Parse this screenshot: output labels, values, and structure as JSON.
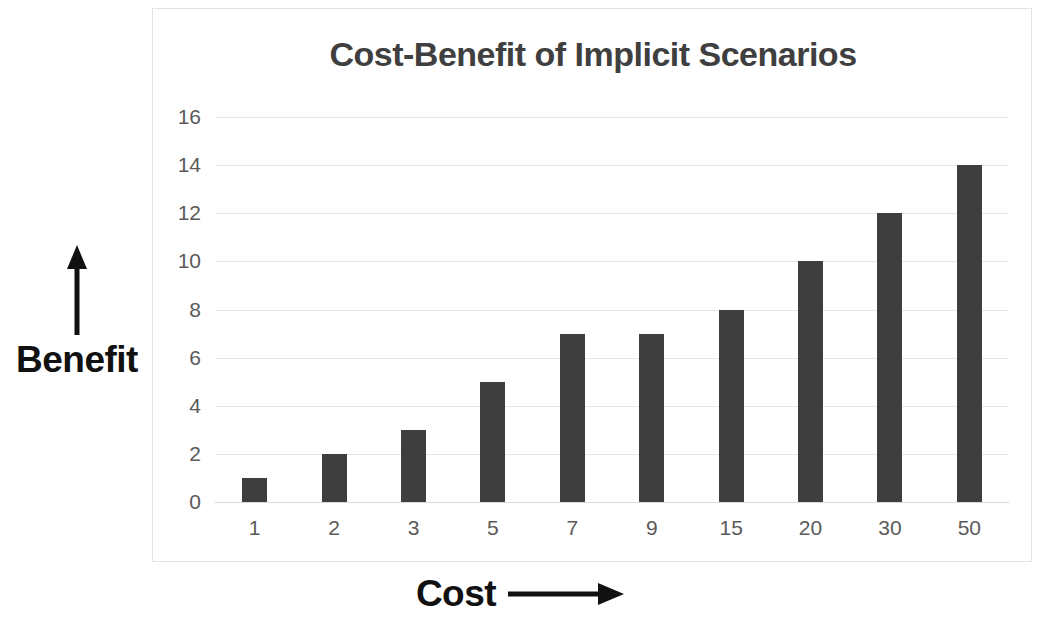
{
  "chart_data": {
    "type": "bar",
    "title": "Cost-Benefit of Implicit Scenarios",
    "xlabel": "Cost",
    "ylabel": "Benefit",
    "categories": [
      "1",
      "2",
      "3",
      "5",
      "7",
      "9",
      "15",
      "20",
      "30",
      "50"
    ],
    "values": [
      1,
      2,
      3,
      5,
      7,
      7,
      8,
      10,
      12,
      14
    ],
    "series": [
      {
        "name": "Benefit",
        "values": [
          1,
          2,
          3,
          5,
          7,
          7,
          8,
          10,
          12,
          14
        ]
      }
    ],
    "ylim": [
      0,
      16
    ],
    "yticks": [
      0,
      2,
      4,
      6,
      8,
      10,
      12,
      14,
      16
    ],
    "ytick_labels": [
      "0",
      "2",
      "4",
      "6",
      "8",
      "10",
      "12",
      "14",
      "16"
    ],
    "grid": true,
    "legend": false,
    "legend_position": "none",
    "bar_color": "#3e3e3e",
    "gridline_color": "#e6e6e6",
    "title_color": "#3f3f3f",
    "tick_label_color": "#5a5a5a",
    "axis_label_color": "#111111",
    "frame_color": "#e3e3e3",
    "background_color": "#ffffff",
    "xlabel_arrow": "right-arrow",
    "ylabel_arrow": "up-arrow",
    "annotations": []
  }
}
